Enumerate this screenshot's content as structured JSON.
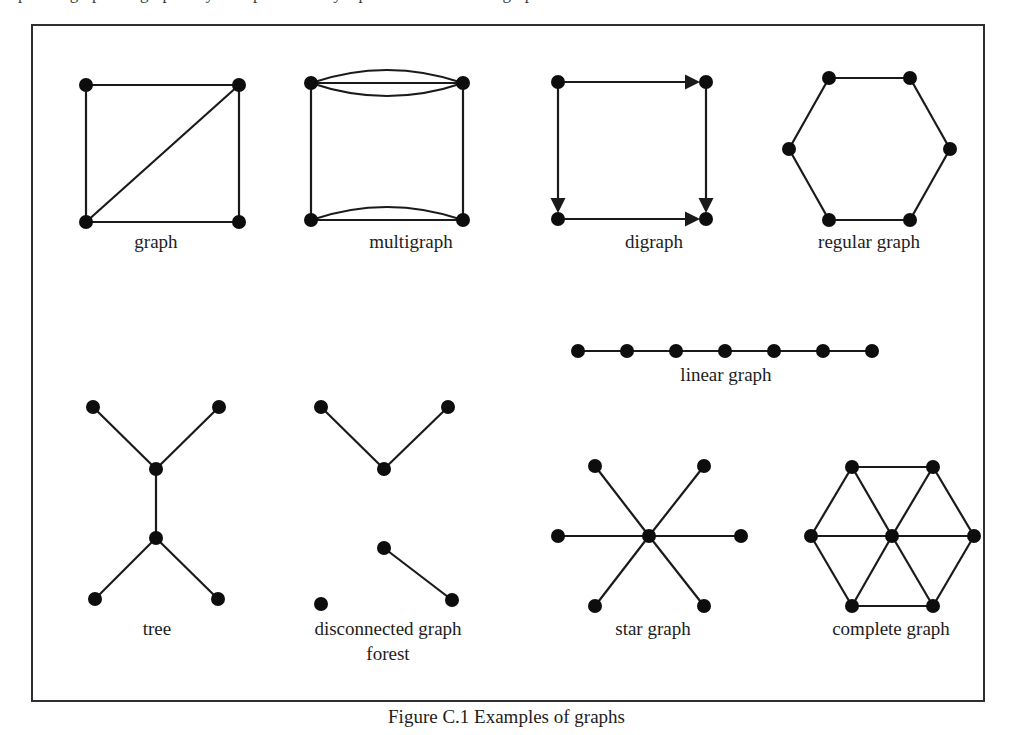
{
  "page": {
    "top_cut_text": "ples of graphs. A graph may be represented by a picture in which the graph's...",
    "figure_caption": "Figure C.1  Examples of graphs",
    "background_color": "#ffffff",
    "ink_color": "#1a1a1a",
    "node_color": "#0d0d0d",
    "frame_color": "#2f2f33"
  },
  "figure": {
    "width": 954,
    "height": 678,
    "node_radius": 7,
    "edge_width": 2.2,
    "panels": [
      {
        "id": "graph",
        "label": "graph",
        "label_lines": [
          "graph"
        ],
        "label_x": 123,
        "label_y": 222,
        "node_count": 4,
        "edge_count": 5,
        "nodes": [
          {
            "x": 53,
            "y": 59
          },
          {
            "x": 206,
            "y": 59
          },
          {
            "x": 53,
            "y": 196
          },
          {
            "x": 206,
            "y": 196
          }
        ],
        "edges": [
          {
            "type": "line",
            "from": 0,
            "to": 1
          },
          {
            "type": "line",
            "from": 0,
            "to": 2
          },
          {
            "type": "line",
            "from": 1,
            "to": 3
          },
          {
            "type": "line",
            "from": 2,
            "to": 3
          },
          {
            "type": "line",
            "from": 2,
            "to": 1
          }
        ]
      },
      {
        "id": "multigraph",
        "label": "multigraph",
        "label_lines": [
          "multigraph"
        ],
        "label_x": 378,
        "label_y": 222,
        "node_count": 4,
        "edge_count": 6,
        "nodes": [
          {
            "x": 278,
            "y": 57
          },
          {
            "x": 430,
            "y": 57
          },
          {
            "x": 278,
            "y": 194
          },
          {
            "x": 430,
            "y": 194
          }
        ],
        "edges": [
          {
            "type": "line",
            "from": 0,
            "to": 1
          },
          {
            "type": "arc",
            "from": 0,
            "to": 1,
            "bow": -13
          },
          {
            "type": "arc",
            "from": 0,
            "to": 1,
            "bow": 13
          },
          {
            "type": "line",
            "from": 0,
            "to": 2
          },
          {
            "type": "line",
            "from": 1,
            "to": 3
          },
          {
            "type": "line",
            "from": 2,
            "to": 3
          },
          {
            "type": "arc",
            "from": 2,
            "to": 3,
            "bow": -13
          }
        ]
      },
      {
        "id": "digraph",
        "label": "digraph",
        "label_lines": [
          "digraph"
        ],
        "label_x": 621,
        "label_y": 222,
        "node_count": 4,
        "edge_count": 4,
        "nodes": [
          {
            "x": 525,
            "y": 56
          },
          {
            "x": 673,
            "y": 56
          },
          {
            "x": 525,
            "y": 193
          },
          {
            "x": 673,
            "y": 193
          }
        ],
        "edges": [
          {
            "type": "arrow",
            "from": 0,
            "to": 1
          },
          {
            "type": "arrow",
            "from": 0,
            "to": 2
          },
          {
            "type": "arrow",
            "from": 2,
            "to": 3
          },
          {
            "type": "arrow",
            "from": 1,
            "to": 3
          }
        ]
      },
      {
        "id": "regular-graph",
        "label": "regular graph",
        "label_lines": [
          "regular graph"
        ],
        "label_x": 836,
        "label_y": 222,
        "node_count": 6,
        "edge_count": 6,
        "nodes": [
          {
            "x": 796,
            "y": 52
          },
          {
            "x": 877,
            "y": 52
          },
          {
            "x": 917,
            "y": 123
          },
          {
            "x": 877,
            "y": 194
          },
          {
            "x": 796,
            "y": 194
          },
          {
            "x": 756,
            "y": 123
          }
        ],
        "edges": [
          {
            "type": "line",
            "from": 0,
            "to": 1
          },
          {
            "type": "line",
            "from": 1,
            "to": 2
          },
          {
            "type": "line",
            "from": 2,
            "to": 3
          },
          {
            "type": "line",
            "from": 3,
            "to": 4
          },
          {
            "type": "line",
            "from": 4,
            "to": 5
          },
          {
            "type": "line",
            "from": 5,
            "to": 0
          }
        ]
      },
      {
        "id": "linear-graph",
        "label": "linear graph",
        "label_lines": [
          "linear graph"
        ],
        "label_x": 693,
        "label_y": 355,
        "node_count": 7,
        "edge_count": 6,
        "nodes": [
          {
            "x": 545,
            "y": 325
          },
          {
            "x": 594,
            "y": 325
          },
          {
            "x": 643,
            "y": 325
          },
          {
            "x": 692,
            "y": 325
          },
          {
            "x": 741,
            "y": 325
          },
          {
            "x": 790,
            "y": 325
          },
          {
            "x": 839,
            "y": 325
          }
        ],
        "edges": [
          {
            "type": "line",
            "from": 0,
            "to": 1
          },
          {
            "type": "line",
            "from": 1,
            "to": 2
          },
          {
            "type": "line",
            "from": 2,
            "to": 3
          },
          {
            "type": "line",
            "from": 3,
            "to": 4
          },
          {
            "type": "line",
            "from": 4,
            "to": 5
          },
          {
            "type": "line",
            "from": 5,
            "to": 6
          }
        ]
      },
      {
        "id": "tree",
        "label": "tree",
        "label_lines": [
          "tree"
        ],
        "label_x": 124,
        "label_y": 609,
        "node_count": 6,
        "edge_count": 5,
        "nodes": [
          {
            "x": 60,
            "y": 381
          },
          {
            "x": 186,
            "y": 381
          },
          {
            "x": 123,
            "y": 443
          },
          {
            "x": 123,
            "y": 512
          },
          {
            "x": 62,
            "y": 573
          },
          {
            "x": 185,
            "y": 573
          }
        ],
        "edges": [
          {
            "type": "line",
            "from": 0,
            "to": 2
          },
          {
            "type": "line",
            "from": 1,
            "to": 2
          },
          {
            "type": "line",
            "from": 2,
            "to": 3
          },
          {
            "type": "line",
            "from": 3,
            "to": 4
          },
          {
            "type": "line",
            "from": 3,
            "to": 5
          }
        ]
      },
      {
        "id": "disconnected-graph-forest",
        "label": "disconnected graph forest",
        "label_lines": [
          "disconnected graph",
          "forest"
        ],
        "label_x": 355,
        "label_y": 609,
        "node_count": 6,
        "edge_count": 3,
        "nodes": [
          {
            "x": 288,
            "y": 381
          },
          {
            "x": 415,
            "y": 381
          },
          {
            "x": 351,
            "y": 443
          },
          {
            "x": 351,
            "y": 522
          },
          {
            "x": 419,
            "y": 574
          },
          {
            "x": 288,
            "y": 578
          }
        ],
        "edges": [
          {
            "type": "line",
            "from": 0,
            "to": 2
          },
          {
            "type": "line",
            "from": 1,
            "to": 2
          },
          {
            "type": "line",
            "from": 3,
            "to": 4
          }
        ]
      },
      {
        "id": "star-graph",
        "label": "star graph",
        "label_lines": [
          "star graph"
        ],
        "label_x": 620,
        "label_y": 609,
        "node_count": 7,
        "edge_count": 6,
        "nodes": [
          {
            "x": 616,
            "y": 510
          },
          {
            "x": 562,
            "y": 440
          },
          {
            "x": 671,
            "y": 440
          },
          {
            "x": 708,
            "y": 510
          },
          {
            "x": 671,
            "y": 580
          },
          {
            "x": 562,
            "y": 580
          },
          {
            "x": 525,
            "y": 510
          }
        ],
        "edges": [
          {
            "type": "line",
            "from": 0,
            "to": 1
          },
          {
            "type": "line",
            "from": 0,
            "to": 2
          },
          {
            "type": "line",
            "from": 0,
            "to": 3
          },
          {
            "type": "line",
            "from": 0,
            "to": 4
          },
          {
            "type": "line",
            "from": 0,
            "to": 5
          },
          {
            "type": "line",
            "from": 0,
            "to": 6
          }
        ]
      },
      {
        "id": "complete-graph",
        "label": "complete graph",
        "label_lines": [
          "complete graph"
        ],
        "label_x": 858,
        "label_y": 609,
        "node_count": 7,
        "edge_count": 12,
        "nodes": [
          {
            "x": 859,
            "y": 510
          },
          {
            "x": 819,
            "y": 441
          },
          {
            "x": 900,
            "y": 441
          },
          {
            "x": 941,
            "y": 510
          },
          {
            "x": 900,
            "y": 580
          },
          {
            "x": 819,
            "y": 580
          },
          {
            "x": 778,
            "y": 510
          }
        ],
        "edges": [
          {
            "type": "line",
            "from": 1,
            "to": 2
          },
          {
            "type": "line",
            "from": 2,
            "to": 3
          },
          {
            "type": "line",
            "from": 3,
            "to": 4
          },
          {
            "type": "line",
            "from": 4,
            "to": 5
          },
          {
            "type": "line",
            "from": 5,
            "to": 6
          },
          {
            "type": "line",
            "from": 6,
            "to": 1
          },
          {
            "type": "line",
            "from": 0,
            "to": 1
          },
          {
            "type": "line",
            "from": 0,
            "to": 2
          },
          {
            "type": "line",
            "from": 0,
            "to": 3
          },
          {
            "type": "line",
            "from": 0,
            "to": 4
          },
          {
            "type": "line",
            "from": 0,
            "to": 5
          },
          {
            "type": "line",
            "from": 0,
            "to": 6
          }
        ]
      }
    ]
  }
}
